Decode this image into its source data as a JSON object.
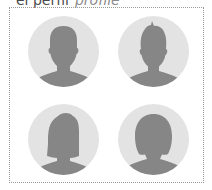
{
  "heading": {
    "term": "el perfil",
    "gloss": "profile"
  },
  "avatars": [
    {
      "icon": "male-silhouette-icon"
    },
    {
      "icon": "male-spiky-hair-silhouette-icon"
    },
    {
      "icon": "female-bob-silhouette-icon"
    },
    {
      "icon": "female-ponytail-silhouette-icon"
    }
  ],
  "colors": {
    "circle": "#e3e3e3",
    "silhouette": "#868686",
    "border": "#9a9a9a",
    "term_text": "#4a4a4a",
    "gloss_text": "#8a8a8a"
  }
}
